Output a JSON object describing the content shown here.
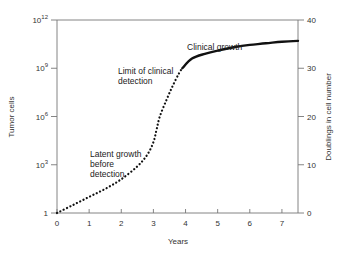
{
  "chart_data": {
    "type": "line",
    "title": "",
    "xlabel": "Years",
    "ylabel": "Tumor cells",
    "ylabel_right": "Doublings in cell number",
    "xlim": [
      0,
      7.5
    ],
    "ylim_log10": [
      0,
      12
    ],
    "ylim_right": [
      0,
      40
    ],
    "x_ticks": [
      "0",
      "1",
      "2",
      "3",
      "4",
      "5",
      "6",
      "7"
    ],
    "y_ticks": [
      {
        "label": "1",
        "exp": "",
        "log10": 0
      },
      {
        "label": "10",
        "exp": "3",
        "log10": 3
      },
      {
        "label": "10",
        "exp": "6",
        "log10": 6
      },
      {
        "label": "10",
        "exp": "9",
        "log10": 9
      },
      {
        "label": "10",
        "exp": "12",
        "log10": 12
      }
    ],
    "y_right_ticks": [
      "0",
      "10",
      "20",
      "30",
      "40"
    ],
    "grid": false,
    "legend": "none",
    "series": [
      {
        "name": "Latent growth before detection",
        "style": "dotted",
        "x": [
          0,
          0.5,
          1.0,
          1.5,
          2.0,
          2.5,
          2.8,
          3.0,
          3.1,
          3.2,
          3.4,
          3.6,
          3.8,
          3.9
        ],
        "log10_cells": [
          0,
          0.5,
          1.0,
          1.5,
          2.1,
          2.9,
          3.6,
          4.4,
          5.2,
          6.0,
          7.0,
          7.9,
          8.7,
          9.0
        ]
      },
      {
        "name": "Clinical growth",
        "style": "solid",
        "x": [
          3.9,
          4.2,
          4.6,
          5.0,
          5.5,
          6.0,
          6.5,
          7.0,
          7.5
        ],
        "log10_cells": [
          9.0,
          9.6,
          9.9,
          10.1,
          10.3,
          10.45,
          10.55,
          10.65,
          10.7
        ]
      }
    ],
    "annotations": [
      {
        "text": [
          "Clinical growth"
        ],
        "x": 4.0,
        "log10": 10.5
      },
      {
        "text": [
          "Limit of clinical",
          "detection"
        ],
        "x": 2.3,
        "log10": 9.2
      },
      {
        "text": [
          "Latent growth",
          "before",
          "detection"
        ],
        "x": 1.6,
        "log10": 4.0
      }
    ]
  },
  "labels": {
    "x_title": "Years",
    "y_title": "Tumor cells",
    "y2_title": "Doublings in cell number",
    "annot_clinical": "Clinical growth",
    "annot_limit_1": "Limit of clinical",
    "annot_limit_2": "detection",
    "annot_latent_1": "Latent growth",
    "annot_latent_2": "before",
    "annot_latent_3": "detection"
  }
}
